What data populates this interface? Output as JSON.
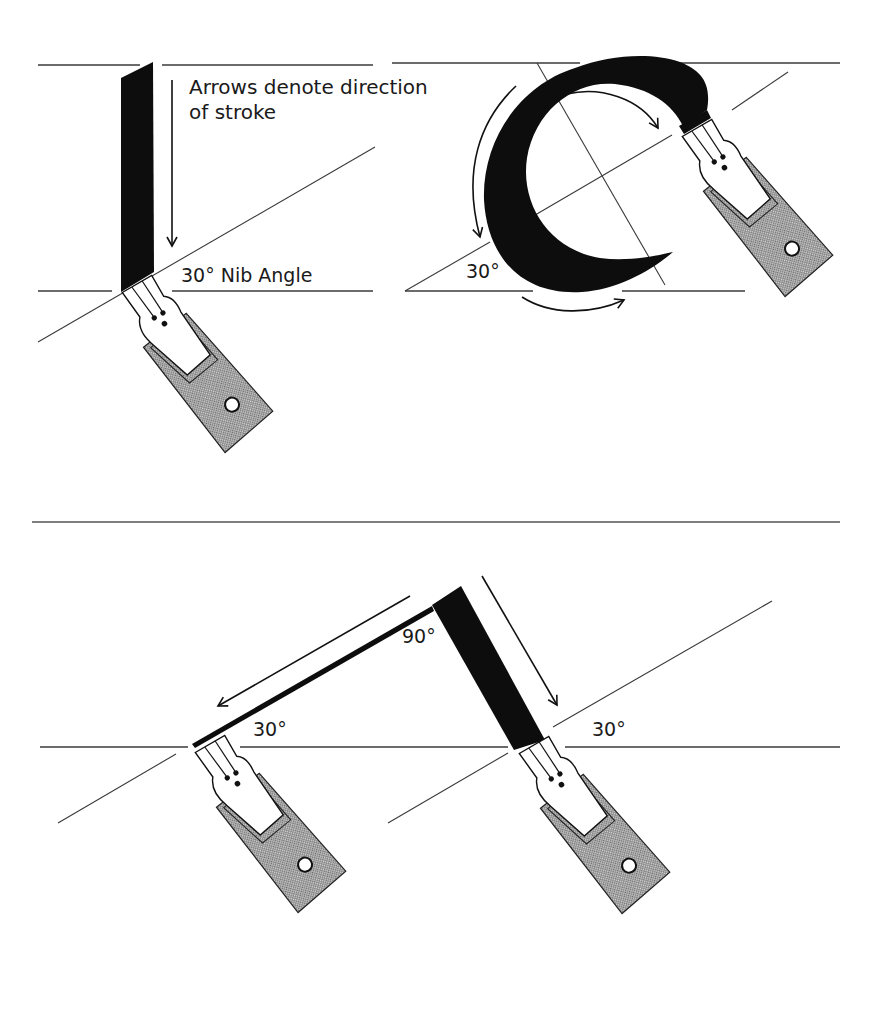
{
  "diagram": {
    "colors": {
      "ink": "#0d0d0d",
      "guide_line": "#3a3a3a",
      "pen_holder_fill": "#bdbdbd",
      "background": "#ffffff"
    },
    "top_panel": {
      "vertical_stroke": {
        "caption_line_1": "Arrows denote direction",
        "caption_line_2": "of stroke",
        "angle_label": "30° Nib Angle"
      },
      "circular_stroke": {
        "angle_label": "30°"
      }
    },
    "bottom_panel": {
      "angled_stroke": {
        "corner_label": "90°",
        "left_angle_label": "30°",
        "right_angle_label": "30°"
      }
    },
    "icons": {
      "pen": "pen-nib-icon",
      "arrow": "direction-arrow-icon"
    }
  }
}
